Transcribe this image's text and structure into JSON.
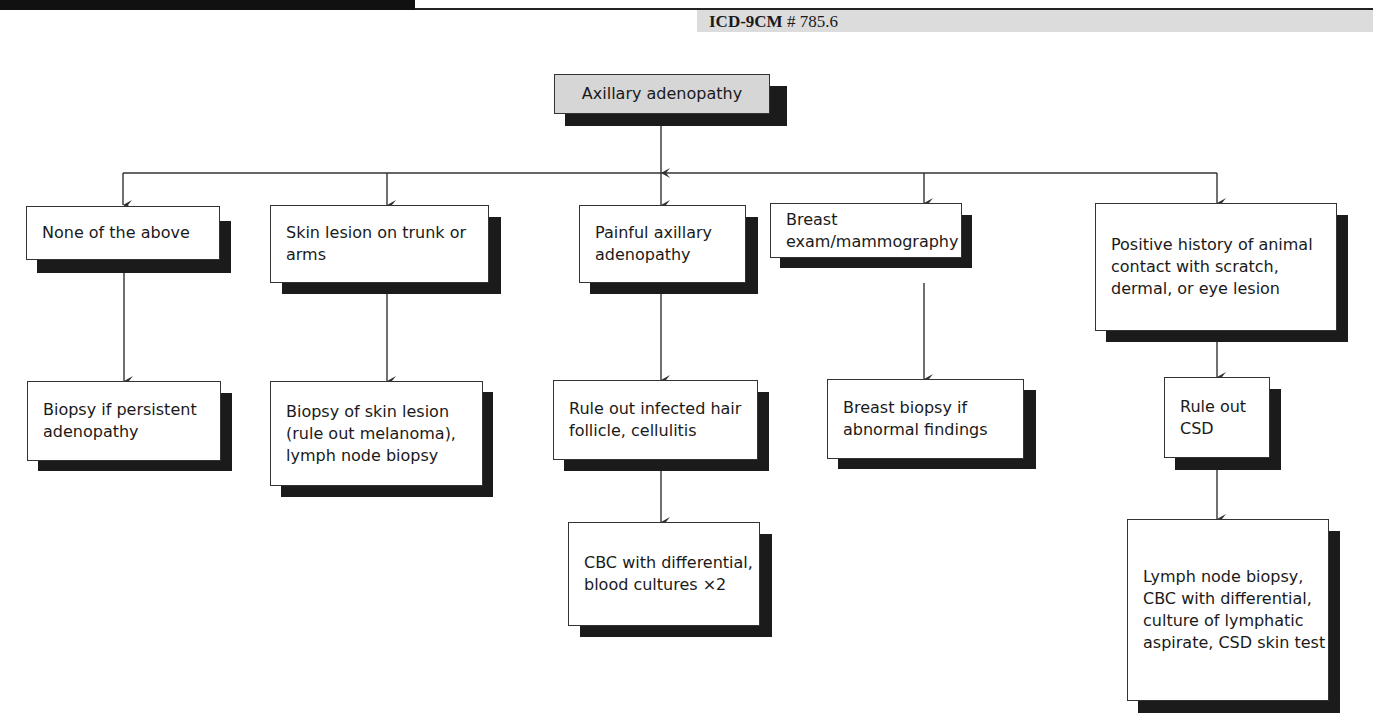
{
  "header": {
    "section_title": "LYMPHADENOPATHY, AXILLARY",
    "icd_label": "ICD-9CM",
    "icd_code": "# 785.6"
  },
  "diagram": {
    "root": "Axillary adenopathy",
    "branches": [
      {
        "condition": "None of the above",
        "steps": [
          "Biopsy if persistent adenopathy"
        ]
      },
      {
        "condition": "Skin lesion on trunk or arms",
        "steps": [
          "Biopsy of skin lesion (rule out melanoma), lymph node biopsy"
        ]
      },
      {
        "condition": "Painful axillary adenopathy",
        "steps": [
          "Rule out infected hair follicle, cellulitis",
          "CBC with differential, blood cultures ×2"
        ]
      },
      {
        "condition": "Breast exam/mammography",
        "steps": [
          "Breast biopsy if abnormal findings"
        ]
      },
      {
        "condition": "Positive history of animal contact with scratch, dermal, or eye lesion",
        "steps": [
          "Rule out CSD",
          "Lymph node biopsy, CBC with differential, culture of lymphatic aspirate, CSD skin test"
        ]
      }
    ]
  },
  "colors": {
    "root_fill": "#d6d6d6",
    "shadow": "#1b1b1b",
    "icd_band": "#dcdcdc",
    "line": "#333333"
  }
}
